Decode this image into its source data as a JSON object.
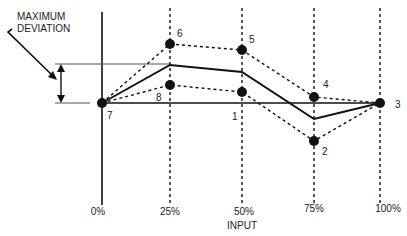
{
  "diagram": {
    "annotation": {
      "line1": "MAXIMUM",
      "line2": "DEVIATION"
    },
    "x_axis": {
      "title": "INPUT",
      "ticks": [
        "0%",
        "25%",
        "50%",
        "75%",
        "100%"
      ]
    },
    "points": [
      {
        "id": "1",
        "label": "1"
      },
      {
        "id": "2",
        "label": "2"
      },
      {
        "id": "3",
        "label": "3"
      },
      {
        "id": "4",
        "label": "4"
      },
      {
        "id": "5",
        "label": "5"
      },
      {
        "id": "6",
        "label": "6"
      },
      {
        "id": "7",
        "label": "7"
      },
      {
        "id": "8",
        "label": "8"
      }
    ],
    "colors": {
      "line": "#111111",
      "background": "#ffffff"
    }
  }
}
